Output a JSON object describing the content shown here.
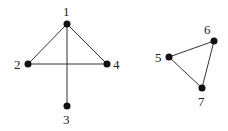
{
  "graph": {
    "nodes": [
      {
        "id": "1",
        "label": "1",
        "x": 67,
        "y": 24,
        "lx": 63,
        "ly": 16
      },
      {
        "id": "2",
        "label": "2",
        "x": 28,
        "y": 64,
        "lx": 14,
        "ly": 69
      },
      {
        "id": "3",
        "label": "3",
        "x": 67,
        "y": 106,
        "lx": 63,
        "ly": 124
      },
      {
        "id": "4",
        "label": "4",
        "x": 107,
        "y": 64,
        "lx": 113,
        "ly": 69
      },
      {
        "id": "5",
        "label": "5",
        "x": 169,
        "y": 57,
        "lx": 155,
        "ly": 62
      },
      {
        "id": "6",
        "label": "6",
        "x": 214,
        "y": 41,
        "lx": 204,
        "ly": 34
      },
      {
        "id": "7",
        "label": "7",
        "x": 202,
        "y": 88,
        "lx": 198,
        "ly": 106
      }
    ],
    "edges": [
      [
        "1",
        "2"
      ],
      [
        "1",
        "4"
      ],
      [
        "1",
        "3"
      ],
      [
        "2",
        "4"
      ],
      [
        "5",
        "6"
      ],
      [
        "6",
        "7"
      ],
      [
        "5",
        "7"
      ]
    ]
  }
}
